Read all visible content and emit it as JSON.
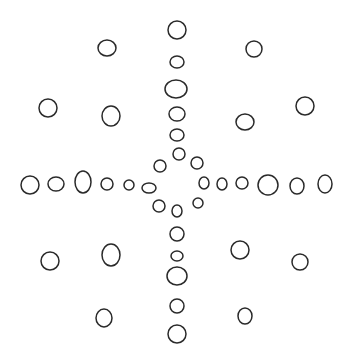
{
  "diagram": {
    "title": "",
    "stroke_color": "#2a2a2a",
    "background_color": "#ffffff",
    "circles": [
      {
        "group": "top-arm",
        "cx": 177,
        "cy": 30,
        "rx": 9,
        "ry": 9
      },
      {
        "group": "top-arm",
        "cx": 177,
        "cy": 62,
        "rx": 7,
        "ry": 6
      },
      {
        "group": "top-arm",
        "cx": 176,
        "cy": 89,
        "rx": 11,
        "ry": 9
      },
      {
        "group": "top-arm",
        "cx": 177,
        "cy": 114,
        "rx": 8,
        "ry": 7
      },
      {
        "group": "top-arm",
        "cx": 177,
        "cy": 135,
        "rx": 7,
        "ry": 6
      },
      {
        "group": "center-ring",
        "cx": 179,
        "cy": 154,
        "rx": 6,
        "ry": 6
      },
      {
        "group": "center-ring",
        "cx": 160,
        "cy": 166,
        "rx": 6,
        "ry": 6
      },
      {
        "group": "center-ring",
        "cx": 197,
        "cy": 163,
        "rx": 6,
        "ry": 6
      },
      {
        "group": "center-ring",
        "cx": 149,
        "cy": 188,
        "rx": 7,
        "ry": 5
      },
      {
        "group": "center-ring",
        "cx": 204,
        "cy": 183,
        "rx": 5,
        "ry": 6
      },
      {
        "group": "center-ring",
        "cx": 159,
        "cy": 206,
        "rx": 6,
        "ry": 6
      },
      {
        "group": "center-ring",
        "cx": 177,
        "cy": 211,
        "rx": 5,
        "ry": 6
      },
      {
        "group": "center-ring",
        "cx": 198,
        "cy": 203,
        "rx": 5,
        "ry": 5
      },
      {
        "group": "left-arm",
        "cx": 30,
        "cy": 185,
        "rx": 9,
        "ry": 9
      },
      {
        "group": "left-arm",
        "cx": 56,
        "cy": 184,
        "rx": 8,
        "ry": 7
      },
      {
        "group": "left-arm",
        "cx": 83,
        "cy": 182,
        "rx": 8,
        "ry": 11
      },
      {
        "group": "left-arm",
        "cx": 107,
        "cy": 184,
        "rx": 6,
        "ry": 6
      },
      {
        "group": "left-arm",
        "cx": 129,
        "cy": 185,
        "rx": 5,
        "ry": 5
      },
      {
        "group": "right-arm",
        "cx": 222,
        "cy": 184,
        "rx": 5,
        "ry": 6
      },
      {
        "group": "right-arm",
        "cx": 242,
        "cy": 183,
        "rx": 6,
        "ry": 6
      },
      {
        "group": "right-arm",
        "cx": 268,
        "cy": 185,
        "rx": 10,
        "ry": 10
      },
      {
        "group": "right-arm",
        "cx": 297,
        "cy": 186,
        "rx": 7,
        "ry": 8
      },
      {
        "group": "right-arm",
        "cx": 325,
        "cy": 184,
        "rx": 7,
        "ry": 9
      },
      {
        "group": "bottom-arm",
        "cx": 177,
        "cy": 234,
        "rx": 7,
        "ry": 7
      },
      {
        "group": "bottom-arm",
        "cx": 177,
        "cy": 256,
        "rx": 6,
        "ry": 5
      },
      {
        "group": "bottom-arm",
        "cx": 177,
        "cy": 276,
        "rx": 10,
        "ry": 9
      },
      {
        "group": "bottom-arm",
        "cx": 177,
        "cy": 306,
        "rx": 7,
        "ry": 7
      },
      {
        "group": "bottom-arm",
        "cx": 177,
        "cy": 334,
        "rx": 9,
        "ry": 9
      },
      {
        "group": "diagonal-nw",
        "cx": 107,
        "cy": 48,
        "rx": 9,
        "ry": 8
      },
      {
        "group": "diagonal-nw",
        "cx": 48,
        "cy": 108,
        "rx": 9,
        "ry": 9
      },
      {
        "group": "diagonal-nw",
        "cx": 111,
        "cy": 116,
        "rx": 9,
        "ry": 10
      },
      {
        "group": "diagonal-ne",
        "cx": 254,
        "cy": 49,
        "rx": 8,
        "ry": 8
      },
      {
        "group": "diagonal-ne",
        "cx": 305,
        "cy": 106,
        "rx": 9,
        "ry": 9
      },
      {
        "group": "diagonal-ne",
        "cx": 245,
        "cy": 122,
        "rx": 9,
        "ry": 8
      },
      {
        "group": "diagonal-sw",
        "cx": 50,
        "cy": 261,
        "rx": 9,
        "ry": 9
      },
      {
        "group": "diagonal-sw",
        "cx": 111,
        "cy": 255,
        "rx": 9,
        "ry": 11
      },
      {
        "group": "diagonal-sw",
        "cx": 104,
        "cy": 318,
        "rx": 8,
        "ry": 9
      },
      {
        "group": "diagonal-se",
        "cx": 240,
        "cy": 250,
        "rx": 9,
        "ry": 9
      },
      {
        "group": "diagonal-se",
        "cx": 300,
        "cy": 262,
        "rx": 8,
        "ry": 8
      },
      {
        "group": "diagonal-se",
        "cx": 245,
        "cy": 316,
        "rx": 7,
        "ry": 8
      }
    ]
  }
}
